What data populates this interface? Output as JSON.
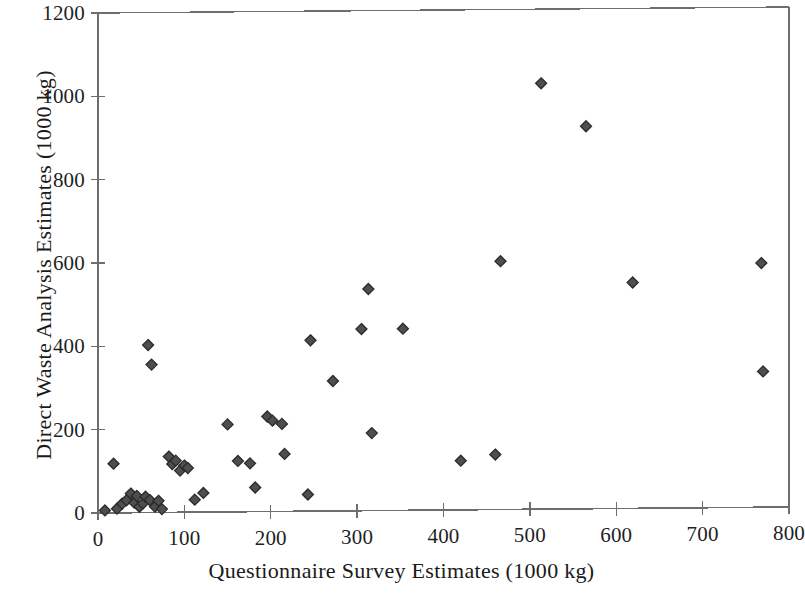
{
  "chart_data": {
    "type": "scatter",
    "title": "",
    "xlabel": "Questionnaire Survey Estimates (1000 kg)",
    "ylabel": "Direct Waste Analysis Estimates (1000 kg)",
    "xlim": [
      0,
      800
    ],
    "ylim": [
      0,
      1200
    ],
    "x_ticks": [
      0,
      100,
      200,
      300,
      400,
      500,
      600,
      700,
      800
    ],
    "y_ticks": [
      0,
      200,
      400,
      600,
      800,
      1000,
      1200
    ],
    "x_tick_labels": [
      "0",
      "100",
      "200",
      "300",
      "400",
      "500",
      "600",
      "700",
      "800"
    ],
    "y_tick_labels": [
      "0",
      "200",
      "400",
      "600",
      "800",
      "1000",
      "1200"
    ],
    "grid": false,
    "legend": null,
    "marker": {
      "shape": "diamond",
      "fill_color": "#4e4e4e",
      "edge_color": "#2b2b2b",
      "size_px": 11
    },
    "axis_color": "#6e6e6e",
    "series": [
      {
        "name": "Waste estimate pairs",
        "points": [
          [
            8,
            6
          ],
          [
            18,
            118
          ],
          [
            22,
            10
          ],
          [
            28,
            22
          ],
          [
            33,
            30
          ],
          [
            38,
            46
          ],
          [
            42,
            24
          ],
          [
            45,
            40
          ],
          [
            48,
            14
          ],
          [
            52,
            22
          ],
          [
            55,
            38
          ],
          [
            58,
            402
          ],
          [
            60,
            30
          ],
          [
            62,
            355
          ],
          [
            66,
            14
          ],
          [
            70,
            28
          ],
          [
            74,
            8
          ],
          [
            82,
            134
          ],
          [
            86,
            116
          ],
          [
            90,
            124
          ],
          [
            95,
            100
          ],
          [
            100,
            112
          ],
          [
            104,
            106
          ],
          [
            112,
            30
          ],
          [
            122,
            46
          ],
          [
            150,
            210
          ],
          [
            162,
            122
          ],
          [
            176,
            116
          ],
          [
            182,
            58
          ],
          [
            196,
            228
          ],
          [
            202,
            218
          ],
          [
            213,
            210
          ],
          [
            216,
            138
          ],
          [
            243,
            40
          ],
          [
            246,
            410
          ],
          [
            272,
            312
          ],
          [
            305,
            436
          ],
          [
            313,
            532
          ],
          [
            317,
            186
          ],
          [
            353,
            436
          ],
          [
            420,
            118
          ],
          [
            460,
            132
          ],
          [
            466,
            596
          ],
          [
            513,
            1022
          ],
          [
            565,
            918
          ],
          [
            619,
            542
          ],
          [
            768,
            586
          ],
          [
            770,
            326
          ]
        ]
      }
    ]
  },
  "axes": {
    "x_title": "Questionnaire Survey Estimates (1000 kg)",
    "y_title": "Direct Waste Analysis Estimates (1000 kg)"
  }
}
